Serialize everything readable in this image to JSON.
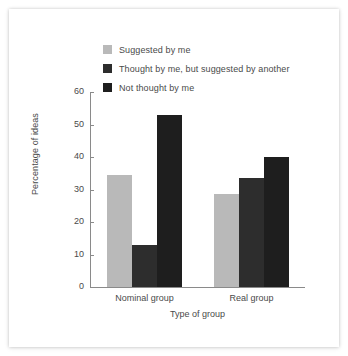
{
  "chart_data": {
    "type": "bar",
    "title": "",
    "xlabel": "Type of group",
    "ylabel": "Percentage of ideas",
    "categories": [
      "Nominal group",
      "Real group"
    ],
    "series": [
      {
        "name": "Suggested by me",
        "color": "#b9b9b9",
        "values": [
          34.5,
          28.5
        ]
      },
      {
        "name": "Thought by me, but suggested by another",
        "color": "#2d2d2d",
        "values": [
          13.0,
          33.5
        ]
      },
      {
        "name": "Not thought by me",
        "color": "#1e1e1e",
        "values": [
          53.0,
          40.0
        ]
      }
    ],
    "ylim": [
      0,
      60
    ],
    "yticks": [
      0,
      10,
      20,
      30,
      40,
      50,
      60
    ],
    "ytick_labels": [
      "0",
      "10",
      "20",
      "30",
      "40",
      "50",
      "60"
    ],
    "grid": false,
    "legend_position": "top-left"
  },
  "legend": {
    "items": [
      {
        "label": "Suggested by me"
      },
      {
        "label": "Thought by me, but suggested by another"
      },
      {
        "label": "Not thought by me"
      }
    ]
  },
  "axes": {
    "y_title": "Percentage of ideas",
    "x_title": "Type of group"
  },
  "colors": {
    "background": "#ffffff",
    "axis": "#8a8a8a",
    "text": "#4a4a4a",
    "series_1": "#b9b9b9",
    "series_2": "#2d2d2d",
    "series_3": "#1e1e1e"
  }
}
